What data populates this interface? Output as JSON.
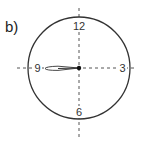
{
  "label": "b)",
  "clock": {
    "numbers": {
      "top": "12",
      "right": "3",
      "bottom": "6",
      "left": "9"
    },
    "hand_direction": "9",
    "colors": {
      "stroke": "#333333",
      "axis": "#555555",
      "background": "#ffffff"
    }
  }
}
